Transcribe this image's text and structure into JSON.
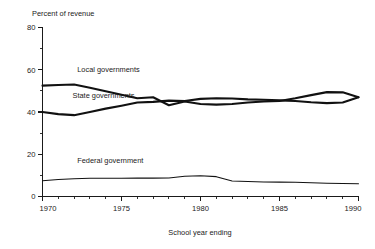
{
  "chart_data": {
    "type": "line",
    "title": "",
    "ylabel": "Percent of revenue",
    "xlabel": "School year ending",
    "ylim": [
      0,
      80
    ],
    "xlim": [
      1970,
      1990
    ],
    "grid": false,
    "legend_position": "inline-labels",
    "y_ticks_major": [
      0,
      20,
      40,
      60,
      80
    ],
    "y_ticks_minor": [
      10,
      30,
      50,
      70
    ],
    "x_ticks_major": [
      1970,
      1975,
      1980,
      1985,
      1990
    ],
    "x_tick_labels": [
      "1970",
      "1975",
      "1980",
      "1985",
      "1990"
    ],
    "y_tick_labels": [
      "0",
      "20",
      "40",
      "60",
      "80"
    ],
    "x": [
      1970,
      1971,
      1972,
      1973,
      1974,
      1975,
      1976,
      1977,
      1978,
      1979,
      1980,
      1981,
      1982,
      1983,
      1984,
      1985,
      1986,
      1987,
      1988,
      1989,
      1990
    ],
    "series": [
      {
        "name": "Local governments",
        "style": "bold",
        "values": [
          52.5,
          52.8,
          53.0,
          51.5,
          49.8,
          48.2,
          46.5,
          47.0,
          43.2,
          45.0,
          43.8,
          43.5,
          43.8,
          44.5,
          45.0,
          45.2,
          46.5,
          48.0,
          49.4,
          49.3,
          47.0
        ]
      },
      {
        "name": "State governments",
        "style": "bold",
        "values": [
          40.0,
          39.0,
          38.5,
          40.0,
          41.6,
          43.0,
          44.5,
          44.8,
          45.4,
          45.2,
          46.2,
          46.5,
          46.4,
          46.0,
          45.8,
          45.5,
          45.2,
          44.6,
          44.2,
          44.5,
          47.0
        ]
      },
      {
        "name": "Federal government",
        "style": "thin",
        "values": [
          7.5,
          8.0,
          8.4,
          8.6,
          8.6,
          8.6,
          8.7,
          8.7,
          8.8,
          9.6,
          9.8,
          9.4,
          7.3,
          7.1,
          6.9,
          6.8,
          6.7,
          6.5,
          6.3,
          6.2,
          6.0
        ]
      }
    ],
    "annotations": [
      {
        "text": "Local governments",
        "x": 1972.2,
        "y": 59.0
      },
      {
        "text": "State governments",
        "x": 1971.9,
        "y": 46.5
      },
      {
        "text": "Federal government",
        "x": 1972.2,
        "y": 16.0
      }
    ]
  },
  "colors": {
    "background": "#ffffff",
    "ink": "#1a1a1a",
    "series_line": "#111111"
  }
}
